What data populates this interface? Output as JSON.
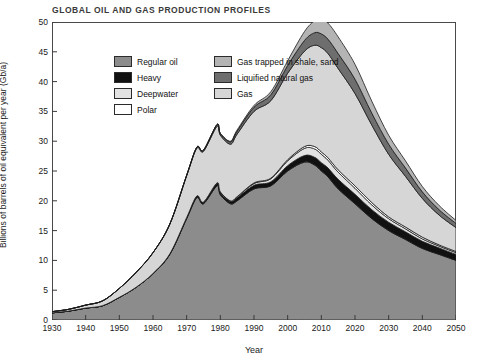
{
  "chart_data": {
    "type": "area",
    "title": "GLOBAL OIL AND GAS PRODUCTION PROFILES",
    "xlabel": "Year",
    "ylabel": "Billions of barrels of oil equivalent per year (Gb/a)",
    "xlim": [
      1930,
      2050
    ],
    "ylim": [
      0,
      50
    ],
    "xticks": [
      1930,
      1940,
      1950,
      1960,
      1970,
      1980,
      1990,
      2000,
      2010,
      2020,
      2030,
      2040,
      2050
    ],
    "yticks": [
      0,
      5,
      10,
      15,
      20,
      25,
      30,
      35,
      40,
      45,
      50
    ],
    "grid": false,
    "legend_position": "top-left",
    "legend": [
      {
        "label": "Regular oil",
        "color": "#8c8c8c"
      },
      {
        "label": "Heavy",
        "color": "#111111"
      },
      {
        "label": "Deepwater",
        "color": "#e2e2e2"
      },
      {
        "label": "Polar",
        "color": "#ffffff"
      },
      {
        "label": "Gas trapped in shale, sand",
        "color": "#b4b4b4"
      },
      {
        "label": "Liquified natural gas",
        "color": "#6e6e6e"
      },
      {
        "label": "Gas",
        "color": "#d6d6d6"
      }
    ],
    "x": [
      1930,
      1935,
      1940,
      1945,
      1950,
      1955,
      1960,
      1965,
      1970,
      1973,
      1975,
      1979,
      1980,
      1983,
      1985,
      1990,
      1995,
      2000,
      2005,
      2008,
      2010,
      2012,
      2015,
      2020,
      2025,
      2030,
      2035,
      2040,
      2045,
      2050
    ],
    "series": [
      {
        "name": "Regular oil",
        "values": [
          1.2,
          1.5,
          2.0,
          2.4,
          3.8,
          5.5,
          7.8,
          11.0,
          17.0,
          20.5,
          19.5,
          22.5,
          21.0,
          19.5,
          20.0,
          22.0,
          22.5,
          25.0,
          26.5,
          26.0,
          25.0,
          24.0,
          22.0,
          19.5,
          17.0,
          15.0,
          13.5,
          12.0,
          11.0,
          10.0
        ]
      },
      {
        "name": "Heavy",
        "values": [
          0.0,
          0.0,
          0.0,
          0.0,
          0.0,
          0.0,
          0.0,
          0.1,
          0.2,
          0.3,
          0.3,
          0.4,
          0.4,
          0.4,
          0.5,
          0.6,
          0.7,
          0.9,
          1.1,
          1.3,
          1.4,
          1.5,
          1.6,
          1.6,
          1.5,
          1.4,
          1.3,
          1.2,
          1.1,
          1.0
        ]
      },
      {
        "name": "Deepwater",
        "values": [
          0.0,
          0.0,
          0.0,
          0.0,
          0.0,
          0.0,
          0.0,
          0.0,
          0.0,
          0.0,
          0.0,
          0.1,
          0.1,
          0.1,
          0.2,
          0.3,
          0.5,
          0.8,
          1.2,
          1.4,
          1.4,
          1.3,
          1.2,
          1.0,
          0.8,
          0.6,
          0.5,
          0.4,
          0.3,
          0.3
        ]
      },
      {
        "name": "Polar",
        "values": [
          0.0,
          0.0,
          0.0,
          0.0,
          0.0,
          0.0,
          0.0,
          0.0,
          0.0,
          0.0,
          0.0,
          0.0,
          0.0,
          0.0,
          0.0,
          0.1,
          0.1,
          0.2,
          0.3,
          0.4,
          0.4,
          0.4,
          0.4,
          0.4,
          0.4,
          0.3,
          0.3,
          0.3,
          0.2,
          0.2
        ]
      },
      {
        "name": "Gas",
        "values": [
          0.2,
          0.3,
          0.5,
          0.8,
          1.5,
          2.5,
          3.5,
          5.0,
          7.0,
          8.0,
          8.5,
          9.5,
          9.5,
          9.5,
          10.5,
          12.0,
          13.0,
          14.5,
          16.0,
          17.0,
          17.5,
          17.5,
          17.0,
          15.5,
          13.0,
          10.5,
          8.5,
          6.5,
          5.0,
          4.0
        ]
      },
      {
        "name": "Liquified natural gas",
        "values": [
          0.0,
          0.0,
          0.0,
          0.0,
          0.0,
          0.0,
          0.0,
          0.0,
          0.1,
          0.2,
          0.2,
          0.3,
          0.3,
          0.4,
          0.5,
          0.7,
          1.0,
          1.3,
          1.8,
          2.1,
          2.3,
          2.4,
          2.5,
          2.4,
          2.0,
          1.7,
          1.4,
          1.1,
          0.9,
          0.7
        ]
      },
      {
        "name": "Gas trapped in shale, sand",
        "values": [
          0.0,
          0.0,
          0.0,
          0.0,
          0.0,
          0.0,
          0.0,
          0.0,
          0.0,
          0.0,
          0.0,
          0.0,
          0.0,
          0.1,
          0.2,
          0.3,
          0.5,
          0.8,
          1.5,
          2.0,
          2.5,
          2.7,
          2.8,
          2.5,
          2.0,
          1.5,
          1.2,
          0.9,
          0.7,
          0.5
        ]
      }
    ],
    "total_peak": {
      "year": 2010,
      "value": 49.0
    }
  }
}
